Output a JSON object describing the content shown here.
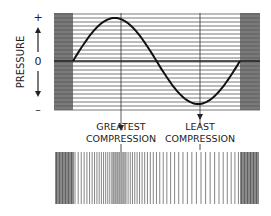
{
  "diagram": {
    "y_axis": {
      "label": "PRESSURE",
      "plus_label": "+",
      "zero_label": "0",
      "minus_label": "–"
    },
    "annotations": {
      "greatest_line1": "GREATEST",
      "greatest_line2": "COMPRESSION",
      "least_line1": "LEAST",
      "least_line2": "COMPRESSION"
    },
    "colors": {
      "ink": "#1a1a1a",
      "gridline": "#555555",
      "band": "#808080"
    }
  },
  "chart_data": {
    "type": "line",
    "title": "",
    "xlabel": "",
    "ylabel": "PRESSURE",
    "x": [
      0,
      0.25,
      0.5,
      0.75,
      1.0
    ],
    "series": [
      {
        "name": "pressure",
        "values": [
          0,
          1,
          0,
          -1,
          0
        ]
      }
    ],
    "annotations": [
      {
        "text": "GREATEST COMPRESSION",
        "x": 0.25
      },
      {
        "text": "LEAST COMPRESSION",
        "x": 0.75
      }
    ],
    "ylim": [
      -1,
      1
    ],
    "grid": true
  }
}
